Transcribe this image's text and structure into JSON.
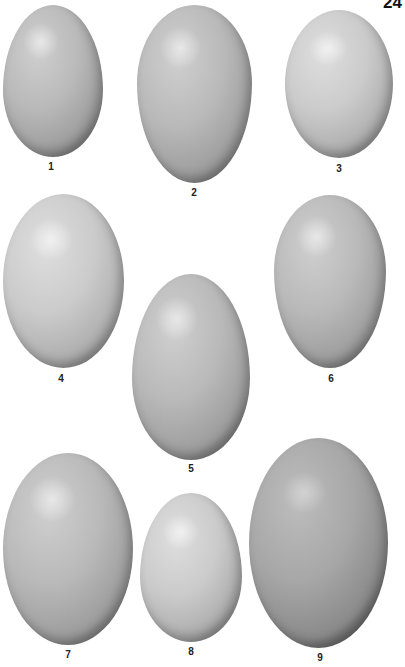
{
  "page": {
    "number": "24",
    "background": "#ffffff"
  },
  "plate": {
    "eggs": [
      {
        "id": 1,
        "label": "1",
        "shape": "ovate",
        "tone": "medium"
      },
      {
        "id": 2,
        "label": "2",
        "shape": "pointed-ovate",
        "tone": "medium"
      },
      {
        "id": 3,
        "label": "3",
        "shape": "oval",
        "tone": "light"
      },
      {
        "id": 4,
        "label": "4",
        "shape": "oval",
        "tone": "light"
      },
      {
        "id": 5,
        "label": "5",
        "shape": "elliptical",
        "tone": "medium"
      },
      {
        "id": 6,
        "label": "6",
        "shape": "pointed-ovate",
        "tone": "medium"
      },
      {
        "id": 7,
        "label": "7",
        "shape": "oval",
        "tone": "medium"
      },
      {
        "id": 8,
        "label": "8",
        "shape": "ovate",
        "tone": "light"
      },
      {
        "id": 9,
        "label": "9",
        "shape": "elliptical",
        "tone": "dark"
      }
    ]
  }
}
